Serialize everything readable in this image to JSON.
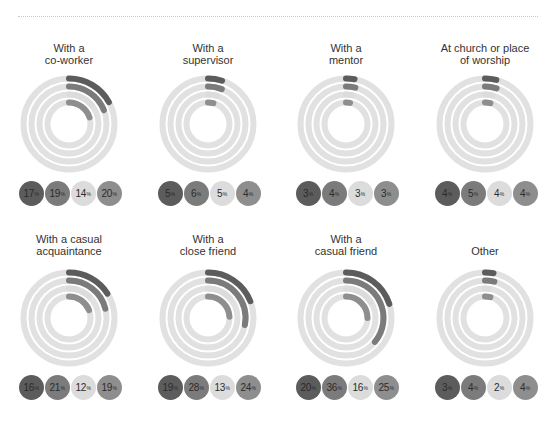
{
  "colors": {
    "track": "#e1e1e1",
    "series": [
      "#5c5c5c",
      "#7b7b7b",
      "#dcdcdc",
      "#8e8e8e"
    ]
  },
  "chart_data": {
    "type": "radial-bar",
    "title": "",
    "series_count": 4,
    "percent_suffix": "%",
    "layout": {
      "grid": "2 rows x 4 columns",
      "ring_order": "outer to inner matches badge order left to right"
    },
    "panels": [
      {
        "title_lines": [
          "With a",
          "co-worker"
        ],
        "values": [
          17,
          19,
          14,
          20
        ]
      },
      {
        "title_lines": [
          "With a",
          "supervisor"
        ],
        "values": [
          5,
          6,
          5,
          4
        ]
      },
      {
        "title_lines": [
          "With a",
          "mentor"
        ],
        "values": [
          3,
          4,
          3,
          3
        ]
      },
      {
        "title_lines": [
          "At church or place",
          "of worship"
        ],
        "values": [
          4,
          5,
          4,
          4
        ]
      },
      {
        "title_lines": [
          "With a casual",
          "acquaintance"
        ],
        "values": [
          16,
          21,
          12,
          19
        ]
      },
      {
        "title_lines": [
          "With a",
          "close friend"
        ],
        "values": [
          19,
          28,
          13,
          24
        ]
      },
      {
        "title_lines": [
          "With a",
          "casual friend"
        ],
        "values": [
          20,
          36,
          16,
          25
        ]
      },
      {
        "title_lines": [
          "",
          "Other"
        ],
        "values": [
          3,
          4,
          2,
          4
        ]
      }
    ]
  }
}
